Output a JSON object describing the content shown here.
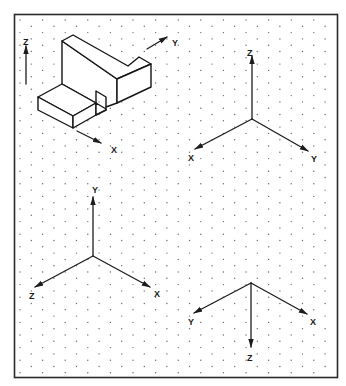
{
  "figure": {
    "colors": {
      "ink": "#1c1c1c",
      "grid_dot": "#6a6a6a",
      "background": "#ffffff"
    }
  },
  "object_view": {
    "axes": [
      {
        "name": "Z",
        "label": "Z",
        "from": [
          26,
          84
        ],
        "to": [
          26,
          46
        ],
        "label_pos": [
          23,
          42
        ]
      },
      {
        "name": "Y",
        "label": "Y",
        "from": [
          147,
          49
        ],
        "to": [
          167,
          37
        ],
        "label_pos": [
          172,
          43
        ]
      },
      {
        "name": "X",
        "label": "X",
        "from": [
          77,
          131
        ],
        "to": [
          101,
          143
        ],
        "label_pos": [
          111,
          150
        ]
      }
    ]
  },
  "triads": [
    {
      "id": "top-right",
      "origin": [
        252,
        119
      ],
      "axes": [
        {
          "label": "Z",
          "tip": [
            252,
            56
          ],
          "label_pos": [
            247,
            53
          ]
        },
        {
          "label": "X",
          "tip": [
            195,
            149
          ],
          "label_pos": [
            188,
            158
          ]
        },
        {
          "label": "Y",
          "tip": [
            308,
            151
          ],
          "label_pos": [
            311,
            159
          ]
        }
      ]
    },
    {
      "id": "bottom-left",
      "origin": [
        93,
        256
      ],
      "axes": [
        {
          "label": "Y",
          "tip": [
            93,
            197
          ],
          "label_pos": [
            92,
            190
          ]
        },
        {
          "label": "Z",
          "tip": [
            35,
            287
          ],
          "label_pos": [
            29,
            296
          ]
        },
        {
          "label": "X",
          "tip": [
            150,
            287
          ],
          "label_pos": [
            154,
            294
          ]
        }
      ]
    },
    {
      "id": "bottom-right",
      "origin": [
        251,
        283
      ],
      "axes": [
        {
          "label": "Y",
          "tip": [
            194,
            313
          ],
          "label_pos": [
            188,
            322
          ]
        },
        {
          "label": "X",
          "tip": [
            307,
            314
          ],
          "label_pos": [
            310,
            322
          ]
        },
        {
          "label": "Z",
          "tip": [
            251,
            347
          ],
          "label_pos": [
            247,
            358
          ]
        }
      ]
    }
  ]
}
